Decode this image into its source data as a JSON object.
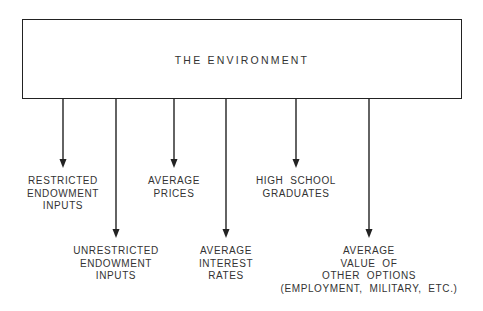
{
  "diagram": {
    "title": "THE ENVIRONMENT",
    "outputs": [
      {
        "id": "restricted-endowment-inputs",
        "lines": [
          "RESTRICTED",
          "ENDOWMENT",
          "INPUTS"
        ],
        "x": 63,
        "arrow_end_y": 168,
        "label_top": 175
      },
      {
        "id": "unrestricted-endowment-inputs",
        "lines": [
          "UNRESTRICTED",
          "ENDOWMENT",
          "INPUTS"
        ],
        "x": 116,
        "arrow_end_y": 238,
        "label_top": 245
      },
      {
        "id": "average-prices",
        "lines": [
          "AVERAGE",
          "PRICES"
        ],
        "x": 174,
        "arrow_end_y": 168,
        "label_top": 175
      },
      {
        "id": "average-interest-rates",
        "lines": [
          "AVERAGE",
          "INTEREST",
          "RATES"
        ],
        "x": 226,
        "arrow_end_y": 238,
        "label_top": 245
      },
      {
        "id": "high-school-graduates",
        "lines": [
          "HIGH  SCHOOL",
          "GRADUATES"
        ],
        "x": 296,
        "arrow_end_y": 168,
        "label_top": 175
      },
      {
        "id": "average-value-of-other-options",
        "lines": [
          "AVERAGE",
          "VALUE  OF",
          "OTHER  OPTIONS",
          "(EMPLOYMENT,  MILITARY,  ETC.)"
        ],
        "x": 369,
        "arrow_end_y": 238,
        "label_top": 245
      }
    ],
    "line_color": "#222222",
    "box": {
      "left": 22,
      "top": 19,
      "right": 462,
      "bottom": 99
    }
  }
}
